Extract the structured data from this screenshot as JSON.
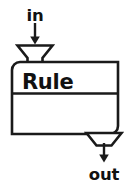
{
  "diagram": {
    "type": "flowchart-block",
    "title": "Rule",
    "background_color": "#ffffff",
    "line_color": "#1a1a1a",
    "text_color": "#111111",
    "input": {
      "label": "in",
      "port_icon": "funnel-down-icon",
      "arrow_icon": "arrow-down-icon",
      "position": "top-left"
    },
    "output": {
      "label": "out",
      "port_icon": "funnel-down-icon",
      "arrow_icon": "arrow-down-icon",
      "position": "bottom-right"
    },
    "body": {
      "header_label": "Rule",
      "content_label": ""
    }
  }
}
